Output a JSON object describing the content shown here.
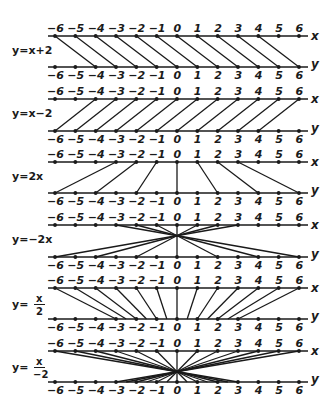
{
  "diagram": {
    "type": "mapping-diagrams",
    "tick_values": [
      -6,
      -5,
      -4,
      -3,
      -2,
      -1,
      0,
      1,
      2,
      3,
      4,
      5,
      6
    ],
    "tick_labels": [
      "−6",
      "−5",
      "−4",
      "−3",
      "−2",
      "−1",
      "0",
      "1",
      "2",
      "3",
      "4",
      "5",
      "6"
    ],
    "top_axis_name": "x",
    "bottom_axis_name": "y",
    "line_color": "#1a1a1a",
    "panels": [
      {
        "id": "p1",
        "label": "y=x+2",
        "label_kind": "text",
        "a": 1,
        "b": 2,
        "top_y": 36,
        "bottom_y": 67
      },
      {
        "id": "p2",
        "label": "y=x−2",
        "label_kind": "text",
        "a": 1,
        "b": -2,
        "top_y": 99,
        "bottom_y": 131
      },
      {
        "id": "p3",
        "label": "y=2x",
        "label_kind": "text",
        "a": 2,
        "b": 0,
        "top_y": 162,
        "bottom_y": 193
      },
      {
        "id": "p4",
        "label": "y=−2x",
        "label_kind": "text",
        "a": -2,
        "b": 0,
        "top_y": 225,
        "bottom_y": 257
      },
      {
        "id": "p5",
        "label": "y=",
        "label_kind": "fraction",
        "numerator": "x",
        "denominator": "2",
        "a": 0.5,
        "b": 0,
        "top_y": 288,
        "bottom_y": 319
      },
      {
        "id": "p6",
        "label": "y=",
        "label_kind": "fraction",
        "numerator": "x",
        "denominator": "−2",
        "a": -0.5,
        "b": 0,
        "top_y": 351,
        "bottom_y": 382
      }
    ]
  },
  "layout": {
    "x_zero": 177,
    "unit": 20.33,
    "axis_start": 48,
    "axis_end": 308,
    "label_x": 12
  }
}
